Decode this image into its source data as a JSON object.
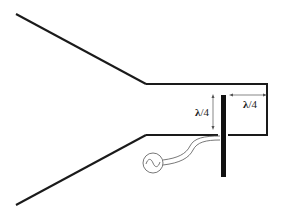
{
  "diagram": {
    "labels": {
      "probe_height_sym": "λ",
      "probe_height_rest": "/4",
      "backshort_distance_sym": "λ",
      "backshort_distance_rest": "/4"
    },
    "components": [
      "horn-flare",
      "waveguide",
      "back-short",
      "monopole-probe",
      "coax-feed",
      "ac-source"
    ],
    "colors": {
      "line": "#1a1a1a",
      "thin": "#555555",
      "background": "#ffffff"
    }
  }
}
